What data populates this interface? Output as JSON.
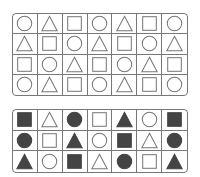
{
  "colors": {
    "stroke": "#777777",
    "fill": "#444444",
    "background": "#ffffff"
  },
  "top_grid": {
    "rows": [
      [
        {
          "shape": "circle",
          "filled": false
        },
        {
          "shape": "triangle",
          "filled": false
        },
        {
          "shape": "square",
          "filled": false
        },
        {
          "shape": "circle",
          "filled": false
        },
        {
          "shape": "triangle",
          "filled": false
        },
        {
          "shape": "square",
          "filled": false
        },
        {
          "shape": "circle",
          "filled": false
        }
      ],
      [
        {
          "shape": "triangle",
          "filled": false
        },
        {
          "shape": "square",
          "filled": false
        },
        {
          "shape": "circle",
          "filled": false
        },
        {
          "shape": "triangle",
          "filled": false
        },
        {
          "shape": "square",
          "filled": false
        },
        {
          "shape": "circle",
          "filled": false
        },
        {
          "shape": "triangle",
          "filled": false
        }
      ],
      [
        {
          "shape": "square",
          "filled": false
        },
        {
          "shape": "circle",
          "filled": false
        },
        {
          "shape": "triangle",
          "filled": false
        },
        {
          "shape": "square",
          "filled": false
        },
        {
          "shape": "circle",
          "filled": false
        },
        {
          "shape": "triangle",
          "filled": false
        },
        {
          "shape": "square",
          "filled": false
        }
      ],
      [
        {
          "shape": "circle",
          "filled": false
        },
        {
          "shape": "triangle",
          "filled": false
        },
        {
          "shape": "square",
          "filled": false
        },
        {
          "shape": "circle",
          "filled": false
        },
        {
          "shape": "triangle",
          "filled": false
        },
        {
          "shape": "square",
          "filled": false
        },
        {
          "shape": "circle",
          "filled": false
        }
      ]
    ]
  },
  "bottom_grid": {
    "rows": [
      [
        {
          "shape": "square",
          "filled": true
        },
        {
          "shape": "triangle",
          "filled": false
        },
        {
          "shape": "circle",
          "filled": true
        },
        {
          "shape": "square",
          "filled": false
        },
        {
          "shape": "triangle",
          "filled": true
        },
        {
          "shape": "circle",
          "filled": false
        },
        {
          "shape": "square",
          "filled": true
        }
      ],
      [
        {
          "shape": "circle",
          "filled": true
        },
        {
          "shape": "square",
          "filled": false
        },
        {
          "shape": "triangle",
          "filled": true
        },
        {
          "shape": "circle",
          "filled": false
        },
        {
          "shape": "square",
          "filled": true
        },
        {
          "shape": "triangle",
          "filled": false
        },
        {
          "shape": "circle",
          "filled": true
        }
      ],
      [
        {
          "shape": "triangle",
          "filled": true
        },
        {
          "shape": "circle",
          "filled": false
        },
        {
          "shape": "square",
          "filled": true
        },
        {
          "shape": "triangle",
          "filled": false
        },
        {
          "shape": "circle",
          "filled": true
        },
        {
          "shape": "square",
          "filled": false
        },
        {
          "shape": "triangle",
          "filled": true
        }
      ]
    ]
  }
}
